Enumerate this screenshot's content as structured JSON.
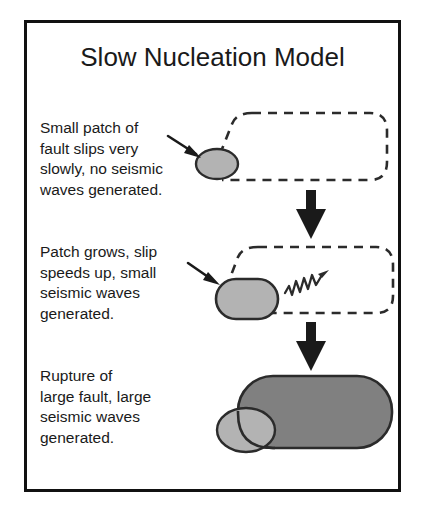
{
  "figure": {
    "title": "Slow Nucleation Model",
    "border_color": "#111111",
    "background_color": "#ffffff"
  },
  "colors": {
    "patch_light_gray": "#b3b3b3",
    "rupture_dark_gray": "#808080",
    "outline": "#2b2b2b",
    "arrow": "#1a1a1a",
    "text": "#1a1a1a"
  },
  "stages": [
    {
      "index": 1,
      "caption": "Small patch of\nfault slips very\nslowly, no seismic\nwaves generated.",
      "fault_box": {
        "style": "dashed",
        "label": "fault-outline-dashed"
      },
      "patch": {
        "label": "slipping-patch-small",
        "fill": "#b3b3b3"
      },
      "pointer": {
        "label": "pointer-arrow",
        "direction": "down-right"
      },
      "seismic_waves": false
    },
    {
      "index": 2,
      "caption": "Patch grows, slip\nspeeds up, small\nseismic waves\ngenerated.",
      "fault_box": {
        "style": "dashed",
        "label": "fault-outline-dashed"
      },
      "patch": {
        "label": "slipping-patch-medium",
        "fill": "#b3b3b3"
      },
      "pointer": {
        "label": "pointer-arrow",
        "direction": "down-right"
      },
      "seismic_waves": true,
      "wave_label": "seismic-wave-squiggle"
    },
    {
      "index": 3,
      "caption": "Rupture of\nlarge fault, large\nseismic waves\ngenerated.",
      "fault_box": {
        "style": "solid-filled",
        "label": "ruptured-fault-large",
        "fill": "#808080"
      },
      "patch": {
        "label": "slipping-patch-residual",
        "fill": "#b3b3b3"
      },
      "pointer": null,
      "seismic_waves": false
    }
  ],
  "flow_arrows": [
    {
      "label": "flow-arrow-stage1-to-stage2",
      "direction": "down"
    },
    {
      "label": "flow-arrow-stage2-to-stage3",
      "direction": "down"
    }
  ]
}
